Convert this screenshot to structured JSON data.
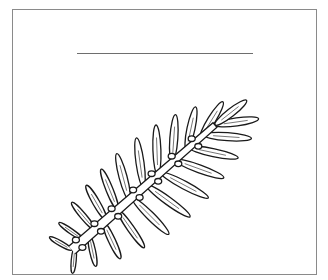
{
  "page": {
    "type": "coloring-page",
    "title_text": "",
    "colors": {
      "background": "#ffffff",
      "frame": "#8a8a8a",
      "line": "#1a1a1a",
      "title_line": "#6e6e6e"
    }
  },
  "frame": {
    "x": 12,
    "y": 9,
    "width": 305,
    "height": 266
  },
  "title_line": {
    "x1": 77,
    "x2": 253,
    "y": 53
  },
  "branch": {
    "stem": {
      "x1": 72,
      "y1": 250,
      "x2": 215,
      "y2": 125
    },
    "upper_leaves": [
      {
        "t": 0.0,
        "len": 26,
        "angle": -150,
        "w": 5
      },
      {
        "t": 0.08,
        "len": 30,
        "angle": -145,
        "w": 5
      },
      {
        "t": 0.16,
        "len": 36,
        "angle": -130,
        "w": 6
      },
      {
        "t": 0.24,
        "len": 40,
        "angle": -120,
        "w": 7
      },
      {
        "t": 0.32,
        "len": 44,
        "angle": -112,
        "w": 7
      },
      {
        "t": 0.4,
        "len": 48,
        "angle": -105,
        "w": 8
      },
      {
        "t": 0.5,
        "len": 50,
        "angle": -98,
        "w": 8
      },
      {
        "t": 0.6,
        "len": 50,
        "angle": -92,
        "w": 8
      },
      {
        "t": 0.7,
        "len": 48,
        "angle": -86,
        "w": 8
      },
      {
        "t": 0.8,
        "len": 44,
        "angle": -78,
        "w": 8
      },
      {
        "t": 0.9,
        "len": 42,
        "angle": -58,
        "w": 8
      },
      {
        "t": 1.0,
        "len": 40,
        "angle": -38,
        "w": 8
      }
    ],
    "lower_leaves": [
      {
        "t": 0.02,
        "len": 26,
        "angle": 95,
        "w": 5
      },
      {
        "t": 0.12,
        "len": 32,
        "angle": 78,
        "w": 6
      },
      {
        "t": 0.22,
        "len": 40,
        "angle": 65,
        "w": 7
      },
      {
        "t": 0.32,
        "len": 46,
        "angle": 55,
        "w": 7
      },
      {
        "t": 0.42,
        "len": 52,
        "angle": 45,
        "w": 8
      },
      {
        "t": 0.52,
        "len": 54,
        "angle": 36,
        "w": 8
      },
      {
        "t": 0.62,
        "len": 54,
        "angle": 28,
        "w": 8
      },
      {
        "t": 0.72,
        "len": 52,
        "angle": 20,
        "w": 8
      },
      {
        "t": 0.82,
        "len": 50,
        "angle": 12,
        "w": 8
      },
      {
        "t": 0.92,
        "len": 48,
        "angle": 4,
        "w": 8
      },
      {
        "t": 1.0,
        "len": 44,
        "angle": -8,
        "w": 8
      }
    ],
    "nodes": [
      0.05,
      0.18,
      0.3,
      0.45,
      0.58,
      0.72,
      0.86
    ]
  }
}
